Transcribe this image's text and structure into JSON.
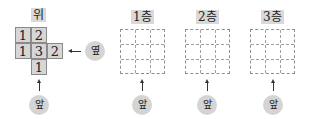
{
  "top_view": {
    "label": "위",
    "cells": [
      {
        "row": 0,
        "col": 0,
        "value": "1"
      },
      {
        "row": 0,
        "col": 1,
        "value": "2"
      },
      {
        "row": 1,
        "col": 0,
        "value": "1"
      },
      {
        "row": 1,
        "col": 1,
        "value": "3"
      },
      {
        "row": 1,
        "col": 2,
        "value": "2"
      },
      {
        "row": 2,
        "col": 1,
        "value": "1"
      }
    ],
    "side_label": "옆",
    "front_label": "앞"
  },
  "floors": [
    {
      "label": "1층",
      "front_label": "앞"
    },
    {
      "label": "2층",
      "front_label": "앞"
    },
    {
      "label": "3층",
      "front_label": "앞"
    }
  ],
  "colors": {
    "cell_fill": "#d6d6d6",
    "label_fill": "#d9d9d9",
    "grid_line": "#8f8f8f"
  }
}
